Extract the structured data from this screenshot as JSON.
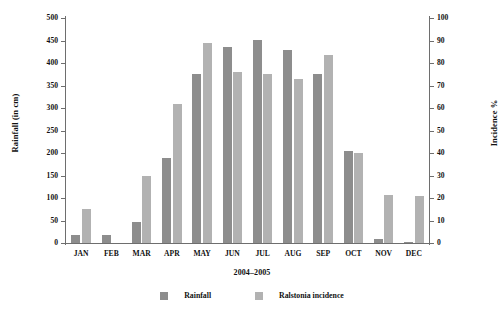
{
  "chart_data": {
    "type": "bar",
    "title": "",
    "xlabel": "2004–2005",
    "ylabel": "Rainfall (in cm)",
    "y2label": "Incidence %",
    "grid": false,
    "legend_position": "bottom",
    "categories": [
      "JAN",
      "FEB",
      "MAR",
      "APR",
      "MAY",
      "JUN",
      "JUL",
      "AUG",
      "SEP",
      "OCT",
      "NOV",
      "DEC"
    ],
    "ylim": [
      0,
      500
    ],
    "yticks": [
      0,
      50,
      100,
      150,
      200,
      250,
      300,
      350,
      400,
      450,
      500
    ],
    "y2lim": [
      0,
      100
    ],
    "y2ticks": [
      0,
      10,
      20,
      30,
      40,
      50,
      60,
      70,
      80,
      90,
      100
    ],
    "series": [
      {
        "name": "Rainfall",
        "axis": "left",
        "unit": "cm",
        "color": "#8d8d8d",
        "values": [
          18,
          18,
          46,
          188,
          375,
          435,
          452,
          428,
          375,
          205,
          8,
          3
        ]
      },
      {
        "name": "Ralstonia incidence",
        "axis": "right",
        "unit": "%",
        "color": "#b2b2b2",
        "values": [
          15,
          0,
          30,
          62,
          89,
          76,
          75,
          73,
          83.5,
          40,
          21.5,
          21
        ]
      }
    ]
  },
  "legend": {
    "items": [
      {
        "label": "Rainfall",
        "color": "#8d8d8d"
      },
      {
        "label": "Ralstonia incidence",
        "color": "#b2b2b2"
      }
    ]
  }
}
